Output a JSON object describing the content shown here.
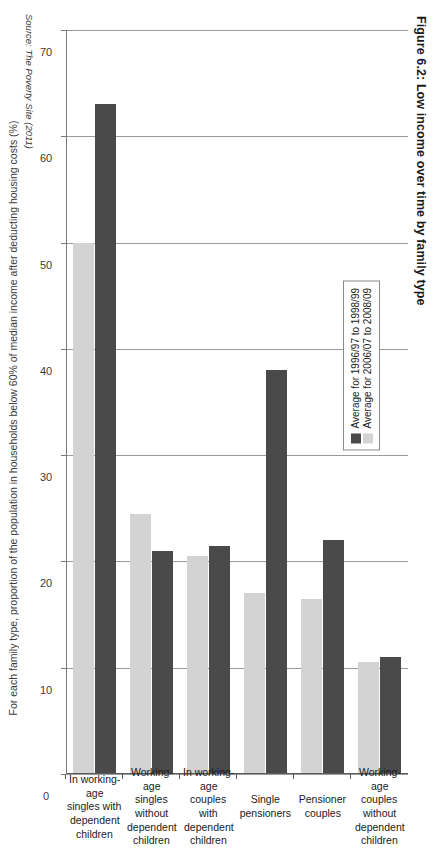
{
  "figure": {
    "title": "Figure 6.2: Low income over time by family type",
    "source": "Source: The Poverty Site (2011)"
  },
  "legend": {
    "position": "upper-left-inside",
    "items": [
      {
        "label": "Average for 1996/97 to 1998/99",
        "color": "#4a4a4a"
      },
      {
        "label": "Average for 2006/07 to 2008/09",
        "color": "#d3d3d3"
      }
    ]
  },
  "colors": {
    "series_1": "#4a4a4a",
    "series_2": "#d3d3d3",
    "gridline": "#9a9a9a",
    "axis": "#7a7a7a",
    "text": "#1a1a1a"
  },
  "axis": {
    "value_axis_title": "For each family type, proportion of the\npopulation in households below 60% of median\nincome after deducting housing costs (%)",
    "ticks": [
      "70",
      "60",
      "50",
      "40",
      "30",
      "20",
      "10",
      "0"
    ]
  },
  "chart_data": {
    "type": "bar",
    "orientation": "horizontal",
    "title": "Figure 6.2: Low income over time by family type",
    "xlabel": "For each family type, proportion of the population in households below 60% of median income after deducting housing costs (%)",
    "ylabel": "",
    "xlim": [
      0,
      70
    ],
    "grid": true,
    "legend_position": "upper left",
    "categories": [
      "Working-age\ncouples without\ndependent\nchildren",
      "Pensioner\ncouples",
      "Single\npensioners",
      "In working-age\ncouples with\ndependent\nchildren",
      "Working-age\nsingles without\ndependent\nchildren",
      "In working-age\nsingles with\ndependent\nchildren"
    ],
    "series": [
      {
        "name": "Average for 1996/97 to 1998/99",
        "color": "#4a4a4a",
        "values": [
          11,
          22,
          38,
          21.5,
          21,
          63
        ]
      },
      {
        "name": "Average for 2006/07 to 2008/09",
        "color": "#d3d3d3",
        "values": [
          10.5,
          16.5,
          17,
          20.5,
          24.5,
          50
        ]
      }
    ],
    "tick_values": [
      70,
      60,
      50,
      40,
      30,
      20,
      10,
      0
    ]
  }
}
